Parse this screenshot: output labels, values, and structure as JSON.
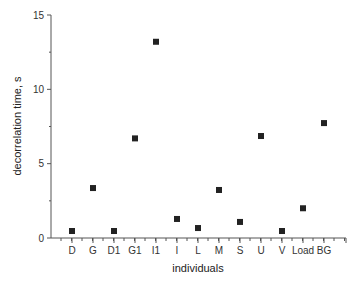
{
  "chart_data": {
    "type": "scatter",
    "title": "",
    "xlabel": "individuals",
    "ylabel": "decorrelation time, s",
    "ylim": [
      0,
      15
    ],
    "yticks": [
      0,
      5,
      10,
      15
    ],
    "grid": false,
    "legend": null,
    "categories": [
      "D",
      "G",
      "D1",
      "G1",
      "I1",
      "I",
      "L",
      "M",
      "S",
      "U",
      "V",
      "Load",
      "BG"
    ],
    "values": [
      0.47,
      3.36,
      0.47,
      6.7,
      13.2,
      1.28,
      0.67,
      3.23,
      1.08,
      6.86,
      0.47,
      2.0,
      7.73
    ],
    "marker": "square",
    "marker_color": "#222222"
  }
}
